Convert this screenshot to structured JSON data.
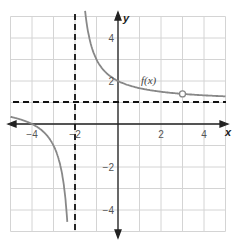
{
  "chart_data": {
    "type": "line",
    "title": "",
    "xlabel": "x",
    "ylabel": "y",
    "xlim": [
      -5,
      5
    ],
    "ylim": [
      -5,
      5
    ],
    "grid": true,
    "x_ticks": [
      -4,
      -2,
      2,
      4
    ],
    "y_ticks": [
      4,
      2,
      -2,
      -4
    ],
    "x_tick_labels": [
      "−4",
      "−2",
      "2",
      "4"
    ],
    "y_tick_labels": [
      "4",
      "2",
      "−2",
      "−4"
    ],
    "series": [
      {
        "name": "f(x)",
        "formula": "f(x) = 1 + 2/(x+2)",
        "label": "f(x)",
        "color": "#808080",
        "points_right_branch": [
          [
            -1.6,
            6
          ],
          [
            -1.5,
            5
          ],
          [
            -1,
            3
          ],
          [
            0,
            2
          ],
          [
            1,
            1.67
          ],
          [
            2,
            1.5
          ],
          [
            3,
            1.4
          ],
          [
            4,
            1.33
          ],
          [
            5,
            1.29
          ]
        ],
        "points_left_branch": [
          [
            -5,
            0.33
          ],
          [
            -4,
            0
          ],
          [
            -3,
            -1
          ],
          [
            -2.5,
            -3
          ],
          [
            -2.29,
            -5
          ]
        ]
      }
    ],
    "asymptotes": [
      {
        "type": "vertical",
        "value": -2,
        "style": "dashed"
      },
      {
        "type": "horizontal",
        "value": 1,
        "style": "dashed"
      }
    ],
    "annotations": [
      {
        "type": "open-circle",
        "x": 3,
        "y": 1.4
      },
      {
        "type": "text",
        "text": "f(x)",
        "x": 1.3,
        "y": 2.1
      }
    ]
  }
}
